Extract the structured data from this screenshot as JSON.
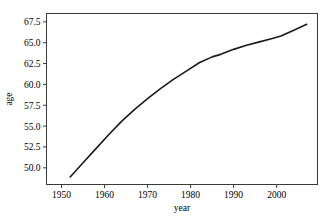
{
  "chart_data": {
    "type": "line",
    "title": "",
    "xlabel": "year",
    "ylabel": "age",
    "xlim": [
      1946.5,
      2009.5
    ],
    "ylim": [
      48.0,
      68.5
    ],
    "xticks": [
      1950,
      1960,
      1970,
      1980,
      1990,
      2000
    ],
    "yticks": [
      50.0,
      52.5,
      55.0,
      57.5,
      60.0,
      62.5,
      65.0,
      67.5
    ],
    "xtick_labels": [
      "1950",
      "1960",
      "1970",
      "1980",
      "1990",
      "2000"
    ],
    "ytick_labels": [
      "50.0",
      "52.5",
      "55.0",
      "57.5",
      "60.0",
      "62.5",
      "65.0",
      "67.5"
    ],
    "grid": false,
    "legend": false,
    "line_color": "#1a1a1a",
    "series": [
      {
        "name": "age",
        "x": [
          1952,
          1955,
          1958,
          1961,
          1964,
          1967,
          1970,
          1973,
          1976,
          1979,
          1982,
          1985,
          1987,
          1990,
          1993,
          1996,
          1999,
          2001,
          2004,
          2007
        ],
        "y": [
          48.9,
          50.6,
          52.3,
          54.0,
          55.6,
          57.0,
          58.3,
          59.5,
          60.6,
          61.6,
          62.6,
          63.3,
          63.6,
          64.2,
          64.7,
          65.1,
          65.5,
          65.8,
          66.5,
          67.2
        ]
      }
    ]
  },
  "axis": {
    "x_title": "year",
    "y_title": "age"
  }
}
